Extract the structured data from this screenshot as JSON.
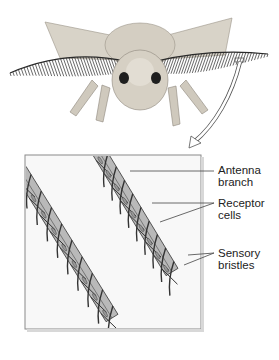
{
  "figure": {
    "labels": [
      {
        "id": "antenna-branch",
        "lines": [
          "Antenna",
          "branch"
        ]
      },
      {
        "id": "receptor-cells",
        "lines": [
          "Receptor",
          "cells"
        ]
      },
      {
        "id": "sensory-bristles",
        "lines": [
          "Sensory",
          "bristles"
        ]
      }
    ]
  },
  "colors": {
    "fur": "#cfc9bd",
    "fur_dark": "#8d877c",
    "antenna": "#2a2a2a",
    "branch_fill": "#b9b9b9",
    "bristle": "#333333",
    "panel_border": "#8a8a8a",
    "panel_bg": "#f7f7f7",
    "leader": "#444444"
  }
}
